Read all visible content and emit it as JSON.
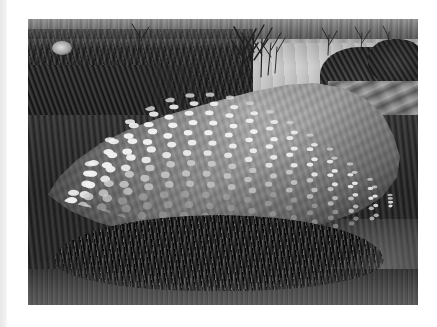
{
  "page": {
    "background_color": "#ffffff",
    "width": 437,
    "height": 327,
    "left_gutter_color": "#ebebeb"
  },
  "photograph": {
    "alt_text": "Black and white photograph of a large boulder covered in a grid of painted light circular dots, resting on grass beside a river",
    "frame": {
      "x": 28,
      "y": 19,
      "width": 390,
      "height": 286
    },
    "tone": "black-and-white",
    "subject": "dotted boulder sculpture",
    "scene_elements": [
      {
        "name": "far-bank",
        "label": "Far bank vegetation"
      },
      {
        "name": "water",
        "label": "River"
      },
      {
        "name": "vegetation-left",
        "label": "Dense shrubs and reeds"
      },
      {
        "name": "bare-trees",
        "label": "Bare trees"
      },
      {
        "name": "bushes-right",
        "label": "Dark bushes"
      },
      {
        "name": "stone-paving",
        "label": "Stone paving slabs"
      },
      {
        "name": "boulder",
        "label": "Dotted boulder"
      },
      {
        "name": "grass-skirt",
        "label": "Grass tufts at base"
      },
      {
        "name": "ground",
        "label": "Ground"
      }
    ],
    "boulder": {
      "dot_color_bright": "#efefef",
      "dot_color_mid": "#cfcfcf",
      "dot_color_dim": "#a6a6a6",
      "surface_color": "#8c8c8c",
      "dot_rows": 13,
      "dot_columns": 17,
      "dot_pattern": "regular grid following surface curvature"
    }
  }
}
